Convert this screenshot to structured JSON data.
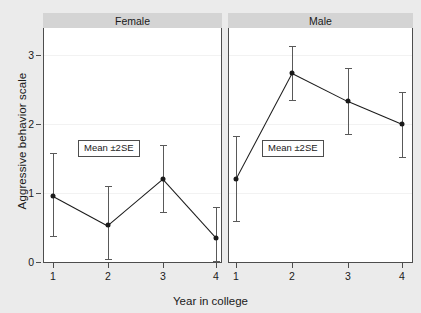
{
  "chart_data": {
    "type": "line",
    "title": "",
    "xlabel": "Year in college",
    "ylabel": "Aggressive behavior scale",
    "x": [
      1,
      2,
      3,
      4
    ],
    "xtick_labels": [
      "1",
      "2",
      "3",
      "4"
    ],
    "ytick_labels": [
      "0",
      "1",
      "2",
      "3"
    ],
    "ytick_values": [
      0,
      1,
      2,
      3
    ],
    "ylim": [
      -0.25,
      3.35
    ],
    "xlim": [
      0.6,
      4.4
    ],
    "grid": true,
    "legend": "none",
    "annotation": "Mean ±2SE",
    "error_type": "±2SE",
    "panels": [
      {
        "label": "Female",
        "series": [
          {
            "name": "Female",
            "values": [
              0.96,
              0.53,
              1.2,
              0.35
            ],
            "err_low": [
              0.37,
              0.04,
              0.73,
              0.02
            ],
            "err_high": [
              1.58,
              1.1,
              1.7,
              0.8
            ]
          }
        ]
      },
      {
        "label": "Male",
        "series": [
          {
            "name": "Male",
            "values": [
              1.21,
              2.74,
              2.33,
              2.0
            ],
            "err_low": [
              0.6,
              2.35,
              1.85,
              1.52
            ],
            "err_high": [
              1.82,
              3.13,
              2.81,
              2.47
            ]
          }
        ]
      }
    ],
    "colors": {
      "figure_background": "#ebebeb",
      "plot_background": "#ffffff",
      "panel_header": "#d4d4d4",
      "line": "#1a1a1a",
      "marker": "#1a1a1a",
      "error_bar": "#595959",
      "gridline": "#f2f2f2",
      "axis": "#4d4d4d",
      "text": "#1a1a1a"
    }
  }
}
